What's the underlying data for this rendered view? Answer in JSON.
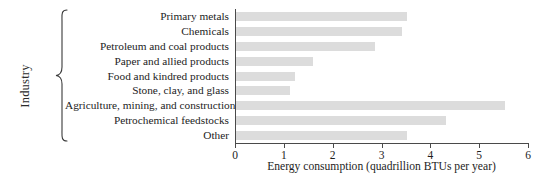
{
  "chart_data": {
    "type": "bar",
    "orientation": "horizontal",
    "title": "",
    "xlabel": "Energy consumption (quadrillion BTUs per year)",
    "ylabel": "Industry",
    "xlim": [
      0,
      6
    ],
    "xticks": [
      "0",
      "1",
      "2",
      "3",
      "4",
      "5",
      "6"
    ],
    "grid": false,
    "legend": null,
    "categories": [
      "Primary metals",
      "Chemicals",
      "Petroleum and coal products",
      "Paper and allied products",
      "Food and kindred products",
      "Stone, clay, and glass",
      "Agriculture, mining, and construction",
      "Petrochemical feedstocks",
      "Other"
    ],
    "values": [
      3.5,
      3.4,
      2.85,
      1.58,
      1.2,
      1.1,
      5.5,
      4.3,
      3.5
    ],
    "bar_color": "#dcdcdc",
    "axis_color": "#4a4a4a",
    "background_color": "#ffffff"
  }
}
